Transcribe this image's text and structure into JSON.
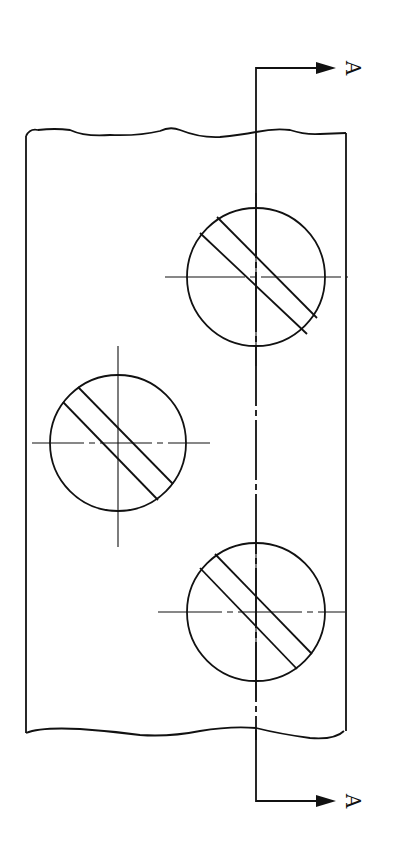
{
  "drawing": {
    "title": "Section view indication with hatched fasteners",
    "stroke_color": "#111111",
    "background": "#ffffff",
    "plate": {
      "left": 26,
      "right": 346,
      "top": 132,
      "bottom": 732
    },
    "section_line": {
      "x": 256,
      "top_y": 68,
      "bottom_y": 801,
      "arrow_tip_x": 336,
      "label": "A"
    },
    "section_labels": {
      "top": "A",
      "bottom": "A"
    },
    "holes": [
      {
        "name": "hole-top-right",
        "cx": 256,
        "cy": 277,
        "r": 69
      },
      {
        "name": "hole-left",
        "cx": 118,
        "cy": 443,
        "r": 68
      },
      {
        "name": "hole-bottom-right",
        "cx": 256,
        "cy": 612,
        "r": 69
      }
    ]
  }
}
